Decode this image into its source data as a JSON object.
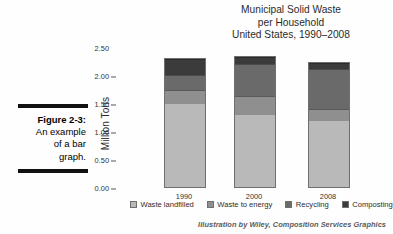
{
  "caption": {
    "figure_label": "Figure 2-3:",
    "text": "An example of a bar graph.",
    "line1": "Figure 2-3:",
    "line2": "An example",
    "line3": "of a bar",
    "line4": "graph."
  },
  "attribution": "Illustration by Wiley, Composition Services Graphics",
  "colors": {
    "waste_landfilled": "#b9b9b9",
    "waste_to_energy": "#8f8f8f",
    "recycling": "#6a6a6a",
    "composting": "#3b3b3b",
    "background": "#fefefe",
    "text": "#2b2b2b"
  },
  "chart_data": {
    "type": "bar",
    "subtype": "stacked",
    "title": "Municipal Solid Waste per Household United States, 1990–2008",
    "title_lines": [
      "Municipal Solid Waste",
      "per Household",
      "United States, 1990–2008"
    ],
    "xlabel": "",
    "ylabel": "Million Tons",
    "categories": [
      "1990",
      "2000",
      "2008"
    ],
    "ylim": [
      0.0,
      2.5
    ],
    "ytick_labels": [
      "0.00",
      "0.50",
      "1.00",
      "1.50",
      "2.00",
      "2.50"
    ],
    "ytick_values": [
      0.0,
      0.5,
      1.0,
      1.5,
      2.0,
      2.5
    ],
    "grid": false,
    "legend_position": "bottom",
    "series": [
      {
        "name": "Waste landfilled",
        "values": [
          1.49,
          1.29,
          1.18
        ],
        "color": "#b9b9b9"
      },
      {
        "name": "Waste to energy",
        "values": [
          0.22,
          0.31,
          0.2
        ],
        "color": "#8f8f8f"
      },
      {
        "name": "Recycling",
        "values": [
          0.26,
          0.57,
          0.69
        ],
        "color": "#6a6a6a"
      },
      {
        "name": "Composting",
        "values": [
          0.27,
          0.09,
          0.1
        ],
        "color": "#3b3b3b"
      }
    ],
    "totals": [
      2.24,
      2.26,
      2.17
    ]
  }
}
